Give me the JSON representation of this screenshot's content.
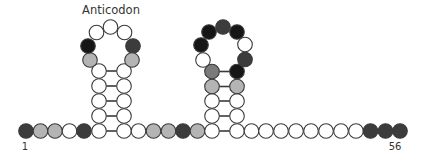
{
  "labels": {
    "anticodon": "Anticodon",
    "start": "1",
    "end": "56"
  },
  "colors": {
    "W": "#ffffff",
    "L": "#b4b4b4",
    "M": "#7a7a7a",
    "D": "#3c3c3c",
    "K": "#161616",
    "stroke": "#3a3a3a",
    "bond": "#3a3a3a"
  },
  "radius": 7.3,
  "backbone": [
    {
      "x": 26,
      "y": 131,
      "c": "D"
    },
    {
      "x": 40.5,
      "y": 131,
      "c": "L"
    },
    {
      "x": 55,
      "y": 131,
      "c": "L"
    },
    {
      "x": 69.5,
      "y": 131,
      "c": "W"
    },
    {
      "x": 84,
      "y": 131,
      "c": "D"
    },
    {
      "x": 99,
      "y": 131,
      "c": "W"
    },
    {
      "x": 124,
      "y": 131,
      "c": "W"
    },
    {
      "x": 138.5,
      "y": 131,
      "c": "W"
    },
    {
      "x": 153.5,
      "y": 131,
      "c": "L"
    },
    {
      "x": 168.5,
      "y": 131,
      "c": "L"
    },
    {
      "x": 183,
      "y": 131,
      "c": "D"
    },
    {
      "x": 197.5,
      "y": 131,
      "c": "L"
    },
    {
      "x": 212,
      "y": 131,
      "c": "W"
    },
    {
      "x": 237,
      "y": 131,
      "c": "W"
    },
    {
      "x": 251.5,
      "y": 131,
      "c": "W"
    },
    {
      "x": 266,
      "y": 131,
      "c": "W"
    },
    {
      "x": 281,
      "y": 131,
      "c": "W"
    },
    {
      "x": 296,
      "y": 131,
      "c": "W"
    },
    {
      "x": 311,
      "y": 131,
      "c": "W"
    },
    {
      "x": 326,
      "y": 131,
      "c": "W"
    },
    {
      "x": 341,
      "y": 131,
      "c": "W"
    },
    {
      "x": 356,
      "y": 131,
      "c": "W"
    },
    {
      "x": 370.5,
      "y": 131,
      "c": "D"
    },
    {
      "x": 385.5,
      "y": 131,
      "c": "D"
    },
    {
      "x": 400,
      "y": 131,
      "c": "D"
    }
  ],
  "stem1": {
    "left_x": 99,
    "right_x": 124,
    "rows": [
      {
        "y": 116,
        "l": "W",
        "r": "W"
      },
      {
        "y": 101,
        "l": "W",
        "r": "W"
      },
      {
        "y": 86,
        "l": "W",
        "r": "W"
      },
      {
        "y": 71,
        "l": "W",
        "r": "W"
      }
    ],
    "loop": [
      {
        "x": 90,
        "y": 60,
        "c": "L"
      },
      {
        "x": 88,
        "y": 46,
        "c": "K"
      },
      {
        "x": 96.5,
        "y": 32.5,
        "c": "W"
      },
      {
        "x": 110.5,
        "y": 27,
        "c": "W"
      },
      {
        "x": 124.5,
        "y": 32.5,
        "c": "W"
      },
      {
        "x": 133,
        "y": 46,
        "c": "D"
      },
      {
        "x": 132,
        "y": 60,
        "c": "L"
      }
    ]
  },
  "stem2": {
    "left_x": 212,
    "right_x": 237,
    "rows": [
      {
        "y": 116,
        "l": "W",
        "r": "W"
      },
      {
        "y": 101,
        "l": "W",
        "r": "W"
      },
      {
        "y": 86.5,
        "l": "L",
        "r": "L"
      },
      {
        "y": 71.5,
        "l": "M",
        "r": "K"
      }
    ],
    "loop": [
      {
        "x": 203,
        "y": 60,
        "c": "W"
      },
      {
        "x": 201,
        "y": 45,
        "c": "K"
      },
      {
        "x": 209,
        "y": 32,
        "c": "K"
      },
      {
        "x": 223,
        "y": 27,
        "c": "D"
      },
      {
        "x": 237,
        "y": 32,
        "c": "K"
      },
      {
        "x": 245,
        "y": 44.5,
        "c": "W"
      },
      {
        "x": 245,
        "y": 59.5,
        "c": "D"
      }
    ]
  },
  "label_positions": {
    "anticodon": {
      "x": 111,
      "y": 14
    },
    "start": {
      "x": 25,
      "y": 150
    },
    "end": {
      "x": 395,
      "y": 150
    }
  }
}
